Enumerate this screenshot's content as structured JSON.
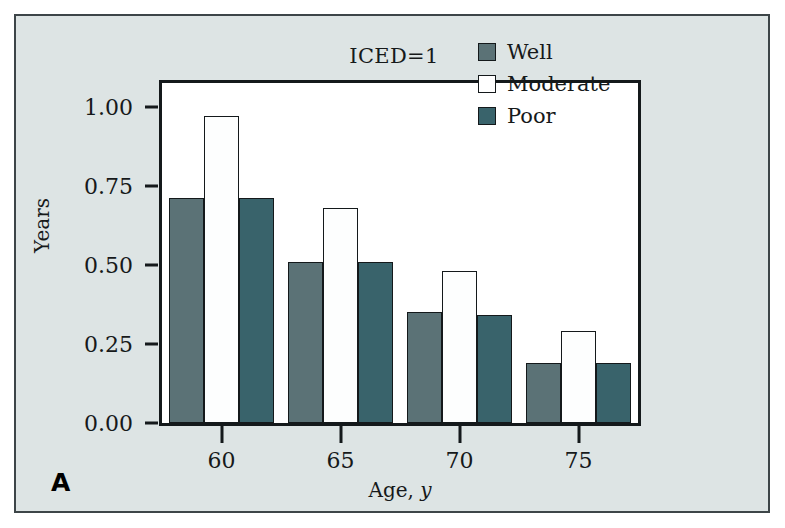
{
  "figure": {
    "panel_label": "A",
    "background_color": "#dde4e4",
    "border_color": "#3d4548"
  },
  "chart_data": {
    "type": "bar",
    "title": "ICED=1",
    "xlabel": "Age, y",
    "xlabel_plain": "Age,",
    "xlabel_italic": "y",
    "ylabel": "Years",
    "categories": [
      "60",
      "65",
      "70",
      "75"
    ],
    "series": [
      {
        "name": "Well",
        "color": "#5b7276",
        "values": [
          0.71,
          0.51,
          0.35,
          0.19
        ]
      },
      {
        "name": "Moderate",
        "color": "#ffffff",
        "values": [
          0.97,
          0.68,
          0.48,
          0.29
        ]
      },
      {
        "name": "Poor",
        "color": "#39636b",
        "values": [
          0.71,
          0.51,
          0.34,
          0.19
        ]
      }
    ],
    "ylim": [
      0.0,
      1.075
    ],
    "yticks": [
      0.0,
      0.25,
      0.5,
      0.75,
      1.0
    ],
    "ytick_labels": [
      "0.00",
      "0.25",
      "0.50",
      "0.75",
      "1.00"
    ],
    "xtick_labels": [
      "60",
      "65",
      "70",
      "75"
    ],
    "grid": false,
    "legend_position": "top-right",
    "legend": [
      {
        "label": "Well",
        "swatch": "well"
      },
      {
        "label": "Moderate",
        "swatch": "moderate"
      },
      {
        "label": "Poor",
        "swatch": "poor"
      }
    ]
  }
}
